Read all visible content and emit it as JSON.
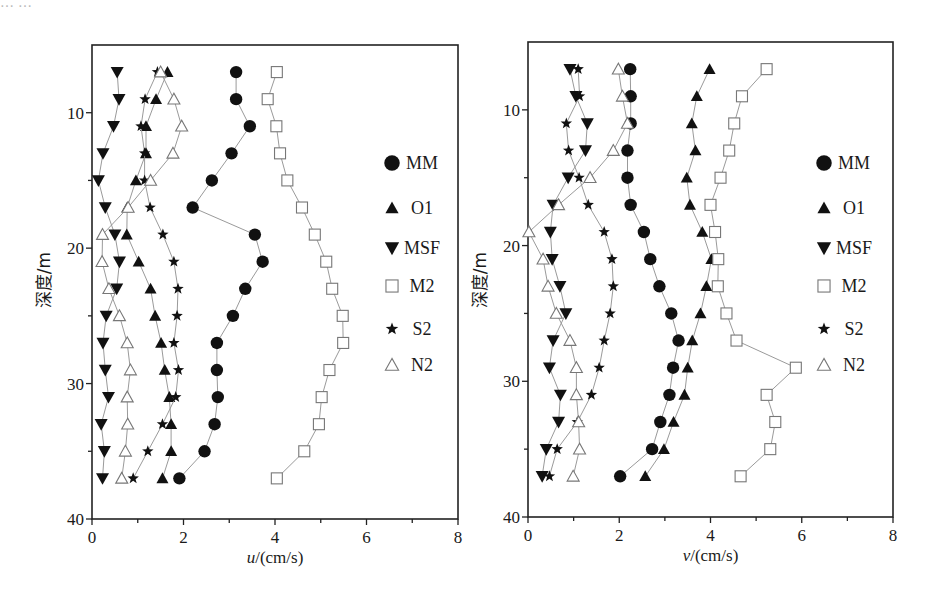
{
  "page": {
    "top_fragment": "……"
  },
  "chart_data": [
    {
      "id": "u-panel",
      "type": "line",
      "title": "",
      "xlabel_italic": "u",
      "xlabel_rest": "/(cm/s)",
      "ylabel": "深度/m",
      "xlim": [
        0,
        8
      ],
      "ylim": [
        40,
        5
      ],
      "y_inverted": true,
      "grid": false,
      "xticks": [
        0,
        2,
        4,
        6,
        8
      ],
      "yticks": [
        10,
        20,
        30,
        40
      ],
      "legend_position": "right-inside",
      "depth": [
        7,
        9,
        11,
        13,
        15,
        17,
        19,
        21,
        23,
        25,
        27,
        29,
        31,
        33,
        35,
        37
      ],
      "series": [
        {
          "name": "MM",
          "marker": "circle-filled",
          "values": [
            3.15,
            3.15,
            3.45,
            3.05,
            2.62,
            2.2,
            3.56,
            3.73,
            3.35,
            3.08,
            2.73,
            2.73,
            2.75,
            2.68,
            2.46,
            1.91
          ]
        },
        {
          "name": "O1",
          "marker": "triangle-up-filled",
          "values": [
            1.65,
            1.4,
            1.18,
            1.18,
            0.96,
            0.77,
            0.76,
            1.02,
            1.28,
            1.38,
            1.51,
            1.59,
            1.69,
            1.73,
            1.73,
            1.54
          ]
        },
        {
          "name": "MSF",
          "marker": "triangle-down-filled",
          "values": [
            0.55,
            0.59,
            0.47,
            0.24,
            0.14,
            0.29,
            0.5,
            0.6,
            0.54,
            0.31,
            0.24,
            0.29,
            0.36,
            0.2,
            0.27,
            0.23
          ]
        },
        {
          "name": "M2",
          "marker": "square-open",
          "values": [
            4.04,
            3.84,
            4.03,
            4.11,
            4.27,
            4.59,
            4.87,
            5.12,
            5.25,
            5.48,
            5.49,
            5.19,
            5.02,
            4.96,
            4.64,
            4.04
          ]
        },
        {
          "name": "S2",
          "marker": "star-filled",
          "values": [
            1.43,
            1.16,
            1.07,
            1.15,
            1.15,
            1.27,
            1.55,
            1.79,
            1.88,
            1.86,
            1.79,
            1.89,
            1.83,
            1.54,
            1.22,
            0.9
          ]
        },
        {
          "name": "N2",
          "marker": "triangle-up-open",
          "values": [
            1.5,
            1.79,
            1.96,
            1.77,
            1.28,
            0.79,
            0.23,
            0.22,
            0.37,
            0.6,
            0.77,
            0.84,
            0.77,
            0.78,
            0.73,
            0.65
          ]
        }
      ]
    },
    {
      "id": "v-panel",
      "type": "line",
      "title": "",
      "xlabel_italic": "v",
      "xlabel_rest": "/(cm/s)",
      "ylabel": "深度/m",
      "xlim": [
        0,
        8
      ],
      "ylim": [
        40,
        5
      ],
      "y_inverted": true,
      "grid": false,
      "xticks": [
        0,
        2,
        4,
        6,
        8
      ],
      "yticks": [
        10,
        20,
        30,
        40
      ],
      "legend_position": "right-inside",
      "depth": [
        7,
        9,
        11,
        13,
        15,
        17,
        19,
        21,
        23,
        25,
        27,
        29,
        31,
        33,
        35,
        37
      ],
      "series": [
        {
          "name": "MM",
          "marker": "circle-filled",
          "values": [
            2.24,
            2.25,
            2.25,
            2.18,
            2.18,
            2.25,
            2.54,
            2.68,
            2.88,
            3.14,
            3.3,
            3.18,
            3.1,
            2.9,
            2.72,
            2.02
          ]
        },
        {
          "name": "O1",
          "marker": "triangle-up-filled",
          "values": [
            3.98,
            3.7,
            3.59,
            3.67,
            3.48,
            3.55,
            3.82,
            4.02,
            3.91,
            3.78,
            3.6,
            3.5,
            3.43,
            3.19,
            2.98,
            2.57
          ]
        },
        {
          "name": "MSF",
          "marker": "triangle-down-filled",
          "values": [
            0.92,
            1.05,
            1.3,
            1.26,
            0.88,
            0.55,
            0.49,
            0.53,
            0.7,
            0.83,
            0.55,
            0.47,
            0.71,
            0.67,
            0.4,
            0.31
          ]
        },
        {
          "name": "M2",
          "marker": "square-open",
          "values": [
            5.23,
            4.69,
            4.52,
            4.41,
            4.22,
            4.0,
            4.1,
            4.17,
            4.16,
            4.35,
            4.57,
            5.87,
            5.23,
            5.42,
            5.31,
            4.66
          ]
        },
        {
          "name": "S2",
          "marker": "star-filled",
          "values": [
            1.1,
            1.13,
            0.84,
            0.89,
            1.12,
            1.32,
            1.67,
            1.84,
            1.87,
            1.8,
            1.67,
            1.56,
            1.39,
            1.08,
            0.64,
            0.47
          ]
        },
        {
          "name": "N2",
          "marker": "triangle-up-open",
          "values": [
            1.98,
            2.07,
            2.18,
            1.87,
            1.36,
            0.67,
            0.02,
            0.33,
            0.44,
            0.62,
            0.92,
            1.06,
            1.06,
            1.11,
            1.13,
            0.99
          ]
        }
      ]
    }
  ],
  "layout": {
    "panels": [
      {
        "x0": 92,
        "x1": 458,
        "y_top": 45,
        "y_bottom": 519,
        "legend_x": 392,
        "legend_y0": 163,
        "ylabel_x": 50,
        "ylabel_y": 280
      },
      {
        "x0": 528,
        "x1": 893,
        "y_top": 42,
        "y_bottom": 517,
        "legend_x": 824,
        "legend_y0": 163,
        "ylabel_x": 486,
        "ylabel_y": 280
      }
    ],
    "legend_row_offsets": [
      0,
      45,
      85,
      123,
      166,
      202
    ],
    "colors": {
      "line": "#9a9a9a",
      "marker": "#111111",
      "open_marker": "#777777",
      "axis": "#222222"
    }
  }
}
